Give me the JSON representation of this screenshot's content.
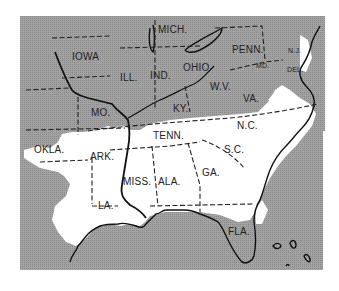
{
  "map": {
    "title": "",
    "colors": {
      "background": "#ffffff",
      "land_shaded": "#9a9a9a",
      "highlight_region": "#ffffff",
      "lines": "#222222"
    },
    "states": [
      {
        "id": "iowa",
        "label": "IOWA"
      },
      {
        "id": "mich",
        "label": "MICH."
      },
      {
        "id": "ill",
        "label": "ILL."
      },
      {
        "id": "ind",
        "label": "IND."
      },
      {
        "id": "ohio",
        "label": "OHIO"
      },
      {
        "id": "penn",
        "label": "PENN."
      },
      {
        "id": "nj",
        "label": "N.J."
      },
      {
        "id": "md",
        "label": "MD."
      },
      {
        "id": "del",
        "label": "DEL."
      },
      {
        "id": "wv",
        "label": "W.V."
      },
      {
        "id": "va",
        "label": "VA."
      },
      {
        "id": "mo",
        "label": "MO."
      },
      {
        "id": "ky",
        "label": "KY."
      },
      {
        "id": "tenn",
        "label": "TENN."
      },
      {
        "id": "nc",
        "label": "N.C."
      },
      {
        "id": "okla",
        "label": "OKLA."
      },
      {
        "id": "ark",
        "label": "ARK."
      },
      {
        "id": "sc",
        "label": "S.C."
      },
      {
        "id": "miss",
        "label": "MISS."
      },
      {
        "id": "ala",
        "label": "ALA."
      },
      {
        "id": "ga",
        "label": "GA."
      },
      {
        "id": "la",
        "label": "LA."
      },
      {
        "id": "fla",
        "label": "FLA."
      }
    ]
  }
}
